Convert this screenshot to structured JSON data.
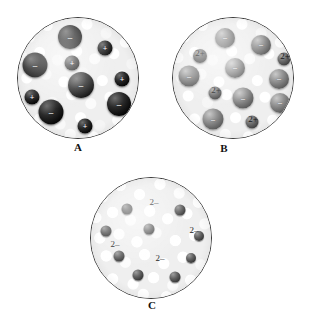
{
  "figure": {
    "header_text": "",
    "panels": [
      {
        "id": "A",
        "label": "A",
        "label_x": 78,
        "label_y": 141,
        "circle": {
          "left": 17,
          "top": 17,
          "size": 122
        },
        "texture": "fine",
        "spheres": [
          {
            "name": "anion-sphere",
            "x": 52,
            "y": 19,
            "d": 24,
            "shade": "black",
            "glyph": "–",
            "fs": 9
          },
          {
            "name": "cation-sphere",
            "x": 87,
            "y": 30,
            "d": 15,
            "shade": "black",
            "glyph": "+",
            "fs": 8
          },
          {
            "name": "anion-sphere",
            "x": 17,
            "y": 47,
            "d": 25,
            "shade": "black",
            "glyph": "–",
            "fs": 9
          },
          {
            "name": "cation-sphere",
            "x": 54,
            "y": 45,
            "d": 15,
            "shade": "black",
            "glyph": "+",
            "fs": 8
          },
          {
            "name": "anion-sphere",
            "x": 63,
            "y": 67,
            "d": 26,
            "shade": "black",
            "glyph": "–",
            "fs": 9
          },
          {
            "name": "cation-sphere",
            "x": 104,
            "y": 61,
            "d": 15,
            "shade": "black",
            "glyph": "+",
            "fs": 8
          },
          {
            "name": "cation-sphere",
            "x": 14,
            "y": 79,
            "d": 15,
            "shade": "black",
            "glyph": "+",
            "fs": 8
          },
          {
            "name": "anion-sphere",
            "x": 101,
            "y": 86,
            "d": 24,
            "shade": "black",
            "glyph": "–",
            "fs": 9
          },
          {
            "name": "anion-sphere",
            "x": 33,
            "y": 94,
            "d": 25,
            "shade": "black",
            "glyph": "–",
            "fs": 9
          },
          {
            "name": "cation-sphere",
            "x": 67,
            "y": 108,
            "d": 15,
            "shade": "black",
            "glyph": "+",
            "fs": 8
          }
        ],
        "charge_labels": []
      },
      {
        "id": "B",
        "label": "B",
        "label_x": 224,
        "label_y": 142,
        "circle": {
          "left": 172,
          "top": 17,
          "size": 122
        },
        "texture": "fine",
        "spheres": [
          {
            "name": "metal-sphere",
            "x": 52,
            "y": 20,
            "d": 20,
            "shade": "gray",
            "glyph": "–",
            "fs": 8
          },
          {
            "name": "metal-sphere",
            "x": 88,
            "y": 27,
            "d": 20,
            "shade": "gray",
            "glyph": "–",
            "fs": 8
          },
          {
            "name": "ion-sphere",
            "x": 27,
            "y": 38,
            "d": 14,
            "shade": "dkgray",
            "glyph": "",
            "fs": 7
          },
          {
            "name": "ion-sphere",
            "x": 111,
            "y": 41,
            "d": 13,
            "shade": "dkgray",
            "glyph": "",
            "fs": 7
          },
          {
            "name": "metal-sphere",
            "x": 62,
            "y": 50,
            "d": 20,
            "shade": "gray",
            "glyph": "–",
            "fs": 8
          },
          {
            "name": "metal-sphere",
            "x": 16,
            "y": 58,
            "d": 21,
            "shade": "gray",
            "glyph": "–",
            "fs": 8
          },
          {
            "name": "metal-sphere",
            "x": 106,
            "y": 61,
            "d": 20,
            "shade": "gray",
            "glyph": "–",
            "fs": 8
          },
          {
            "name": "ion-sphere",
            "x": 42,
            "y": 75,
            "d": 13,
            "shade": "dkgray",
            "glyph": "",
            "fs": 7
          },
          {
            "name": "metal-sphere",
            "x": 70,
            "y": 80,
            "d": 21,
            "shade": "gray",
            "glyph": "–",
            "fs": 8
          },
          {
            "name": "metal-sphere",
            "x": 107,
            "y": 85,
            "d": 20,
            "shade": "gray",
            "glyph": "–",
            "fs": 8
          },
          {
            "name": "metal-sphere",
            "x": 40,
            "y": 101,
            "d": 21,
            "shade": "gray",
            "glyph": "–",
            "fs": 8
          },
          {
            "name": "ion-sphere",
            "x": 79,
            "y": 104,
            "d": 13,
            "shade": "dkgray",
            "glyph": "",
            "fs": 7
          }
        ],
        "charge_labels": [
          {
            "name": "charge-2plus",
            "text": "2+",
            "x": 27,
            "y": 35
          },
          {
            "name": "charge-2plus",
            "text": "2+",
            "x": 112,
            "y": 38
          },
          {
            "name": "charge-2plus",
            "text": "2+",
            "x": 43,
            "y": 72
          },
          {
            "name": "charge-2plus",
            "text": "2+",
            "x": 80,
            "y": 101
          }
        ]
      },
      {
        "id": "C",
        "label": "C",
        "label_x": 152,
        "label_y": 299,
        "circle": {
          "left": 90,
          "top": 177,
          "size": 122
        },
        "texture": "coarse",
        "spheres": [
          {
            "name": "ion-sphere",
            "x": 36,
            "y": 31,
            "d": 11,
            "shade": "small-dk",
            "glyph": "",
            "fs": 6
          },
          {
            "name": "ion-sphere",
            "x": 89,
            "y": 32,
            "d": 11,
            "shade": "small-dk",
            "glyph": "",
            "fs": 6
          },
          {
            "name": "ion-sphere",
            "x": 15,
            "y": 53,
            "d": 11,
            "shade": "small-dk",
            "glyph": "",
            "fs": 6
          },
          {
            "name": "ion-sphere",
            "x": 58,
            "y": 51,
            "d": 11,
            "shade": "small-dk",
            "glyph": "",
            "fs": 6
          },
          {
            "name": "ion-sphere",
            "x": 108,
            "y": 58,
            "d": 10,
            "shade": "small-dk",
            "glyph": "",
            "fs": 6
          },
          {
            "name": "ion-sphere",
            "x": 28,
            "y": 78,
            "d": 11,
            "shade": "small-dk",
            "glyph": "",
            "fs": 6
          },
          {
            "name": "ion-sphere",
            "x": 100,
            "y": 80,
            "d": 10,
            "shade": "small-dk",
            "glyph": "",
            "fs": 6
          },
          {
            "name": "ion-sphere",
            "x": 47,
            "y": 97,
            "d": 11,
            "shade": "small-dk",
            "glyph": "",
            "fs": 6
          },
          {
            "name": "ion-sphere",
            "x": 84,
            "y": 99,
            "d": 11,
            "shade": "small-dk",
            "glyph": "",
            "fs": 6
          }
        ],
        "charge_labels": [
          {
            "name": "charge-2minus",
            "text": "2–",
            "x": 63,
            "y": 24
          },
          {
            "name": "charge-2minus",
            "text": "2–",
            "x": 103,
            "y": 52
          },
          {
            "name": "charge-2minus",
            "text": "2–",
            "x": 24,
            "y": 66
          },
          {
            "name": "charge-2minus",
            "text": "2–",
            "x": 69,
            "y": 80
          }
        ]
      }
    ]
  }
}
